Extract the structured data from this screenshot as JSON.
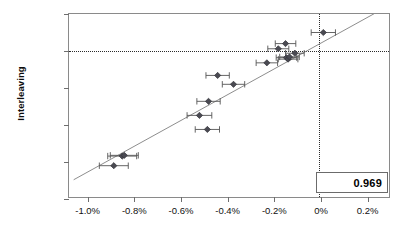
{
  "chart_data": {
    "type": "scatter",
    "title": "",
    "xlabel": "",
    "ylabel": "Interleaving",
    "xlim": [
      -1.08,
      0.3
    ],
    "ylim": [
      -20.0,
      5.0
    ],
    "grid": false,
    "legend": null,
    "x_unit": "%",
    "y_unit": "%",
    "xticks": [
      -1.0,
      -0.8,
      -0.6,
      -0.4,
      -0.2,
      0,
      0.2
    ],
    "xticklabels": [
      "-1.0%",
      "-0.8%",
      "-0.6%",
      "-0.4%",
      "-0.2%",
      "0%",
      "0.2%"
    ],
    "yticks": [
      5.0,
      0,
      -5.0,
      -10.0,
      -15.0,
      -20.0
    ],
    "yticklabels": [
      "5.0%",
      "0%",
      "-5.0%",
      "-10.0%",
      "-15.0%",
      "-20.0%"
    ],
    "reference_lines": {
      "horizontal": 0,
      "vertical": -0.01,
      "style": "dotted"
    },
    "fit_line": {
      "type": "linear",
      "x_start": -1.06,
      "y_start": -17.4,
      "x_end": 0.3,
      "y_end": 6.3,
      "color": "#808080"
    },
    "annotations": [
      {
        "name": "correlation",
        "value": "0.969"
      }
    ],
    "marker": {
      "shape": "diamond",
      "color": "#4a4a52",
      "error_bars": "horizontal",
      "error_bar_color": "#555555"
    },
    "points": [
      {
        "x": -0.888,
        "y": -15.5,
        "xerr": 0.062
      },
      {
        "x": -0.852,
        "y": -14.2,
        "xerr": 0.062
      },
      {
        "x": -0.843,
        "y": -14.1,
        "xerr": 0.06
      },
      {
        "x": -0.521,
        "y": -8.7,
        "xerr": 0.053
      },
      {
        "x": -0.487,
        "y": -10.6,
        "xerr": 0.052
      },
      {
        "x": -0.482,
        "y": -6.8,
        "xerr": 0.05
      },
      {
        "x": -0.443,
        "y": -3.3,
        "xerr": 0.05
      },
      {
        "x": -0.375,
        "y": -4.5,
        "xerr": 0.048
      },
      {
        "x": -0.232,
        "y": -1.6,
        "xerr": 0.046
      },
      {
        "x": -0.183,
        "y": 0.3,
        "xerr": 0.045
      },
      {
        "x": -0.152,
        "y": 1.0,
        "xerr": 0.044
      },
      {
        "x": -0.148,
        "y": -0.9,
        "xerr": 0.044
      },
      {
        "x": -0.141,
        "y": -1.1,
        "xerr": 0.042
      },
      {
        "x": -0.135,
        "y": -0.8,
        "xerr": 0.042
      },
      {
        "x": -0.112,
        "y": -0.3,
        "xerr": 0.04
      },
      {
        "x": 0.01,
        "y": 2.5,
        "xerr": 0.052
      }
    ]
  }
}
